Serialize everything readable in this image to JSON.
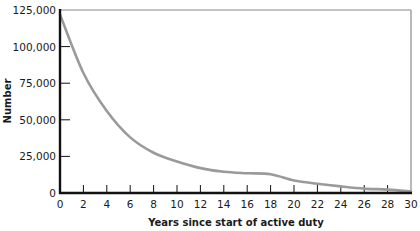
{
  "chart_data": {
    "type": "line",
    "title": "",
    "xlabel": "Years since start of active duty",
    "ylabel": "Number",
    "xlim": [
      0,
      30
    ],
    "ylim": [
      0,
      125000
    ],
    "x_ticks": [
      0,
      2,
      4,
      6,
      8,
      10,
      12,
      14,
      16,
      18,
      20,
      22,
      24,
      26,
      28,
      30
    ],
    "x_tick_labels": [
      "0",
      "2",
      "4",
      "6",
      "8",
      "10",
      "12",
      "14",
      "16",
      "18",
      "20",
      "22",
      "24",
      "26",
      "28",
      "30"
    ],
    "y_ticks": [
      0,
      25000,
      50000,
      75000,
      100000,
      125000
    ],
    "y_tick_labels": [
      "0",
      "25,000",
      "50,000",
      "75,000",
      "100,000",
      "125,000"
    ],
    "grid": false,
    "legend": null,
    "series": [
      {
        "name": "Number",
        "color": "#9a9a9a",
        "x": [
          0,
          2,
          4,
          6,
          8,
          10,
          12,
          14,
          16,
          18,
          20,
          22,
          24,
          26,
          28,
          30
        ],
        "values": [
          122000,
          82000,
          56000,
          38000,
          27500,
          21500,
          17000,
          14500,
          13500,
          12800,
          8500,
          6300,
          4500,
          3000,
          2300,
          1000
        ]
      }
    ]
  },
  "style": {
    "line_color": "#9a9a9a",
    "axis_color": "#111111",
    "frame_color": "#8a8a8a"
  }
}
